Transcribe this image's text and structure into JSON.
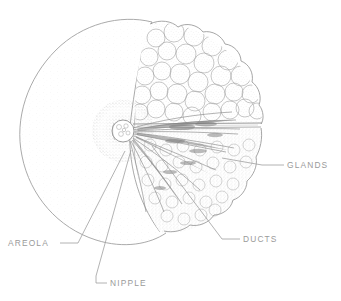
{
  "figure": {
    "style": "stippled line drawing, cutaway section",
    "background_color": "#ffffff",
    "line_color": "#8e8e8e",
    "text_color": "#9a9a9a",
    "stipple_color": "#b9b9b9"
  },
  "labels": [
    {
      "id": "areola",
      "text": "AREOLA",
      "text_x": 8,
      "text_y": 246,
      "anchor": "start",
      "leader": "M 60 243 L 78 243 L 125 151",
      "target": "areola stippled ring around nipple"
    },
    {
      "id": "nipple",
      "text": "NIPPLE",
      "text_x": 110,
      "text_y": 286,
      "anchor": "start",
      "leader": "M 107 283 L 96 283 L 96 276 L 131 150",
      "target": "nipple knob at center"
    },
    {
      "id": "glands",
      "text": "GLANDS",
      "text_x": 287,
      "text_y": 168,
      "anchor": "start",
      "leader": "M 284 165 L 262 165 L 222 158",
      "target": "glandular lobules"
    },
    {
      "id": "ducts",
      "text": "DUCTS",
      "text_x": 243,
      "text_y": 242,
      "anchor": "start",
      "leader": "M 240 239 L 222 239 L 152 146",
      "target": "lactiferous ducts radiating from nipple"
    }
  ],
  "anatomy": {
    "breast_outline": {
      "shape": "circle",
      "center_x": 122,
      "center_y": 131,
      "radius": 108
    },
    "nipple": {
      "center_x": 123,
      "center_y": 131,
      "radius": 11
    },
    "areola": {
      "center_x": 123,
      "center_y": 131,
      "radius": 30
    },
    "section_seam": "M 152 22 C 140 52 134 92 130 126 C 128 160 136 200 160 232",
    "duct_count": 11,
    "lobule_clusters": 46
  }
}
